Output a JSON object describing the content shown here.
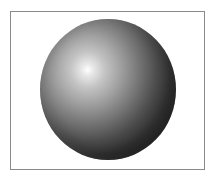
{
  "image": {
    "subject": "shaded gray sphere",
    "frame": {
      "border_color": "#8a8a8a",
      "background": "#ffffff"
    },
    "sphere": {
      "highlight_color": "#ffffff",
      "midtone_color": "#8a8a8a",
      "shadow_color": "#2c2c2c",
      "light_direction": "upper-left"
    }
  }
}
